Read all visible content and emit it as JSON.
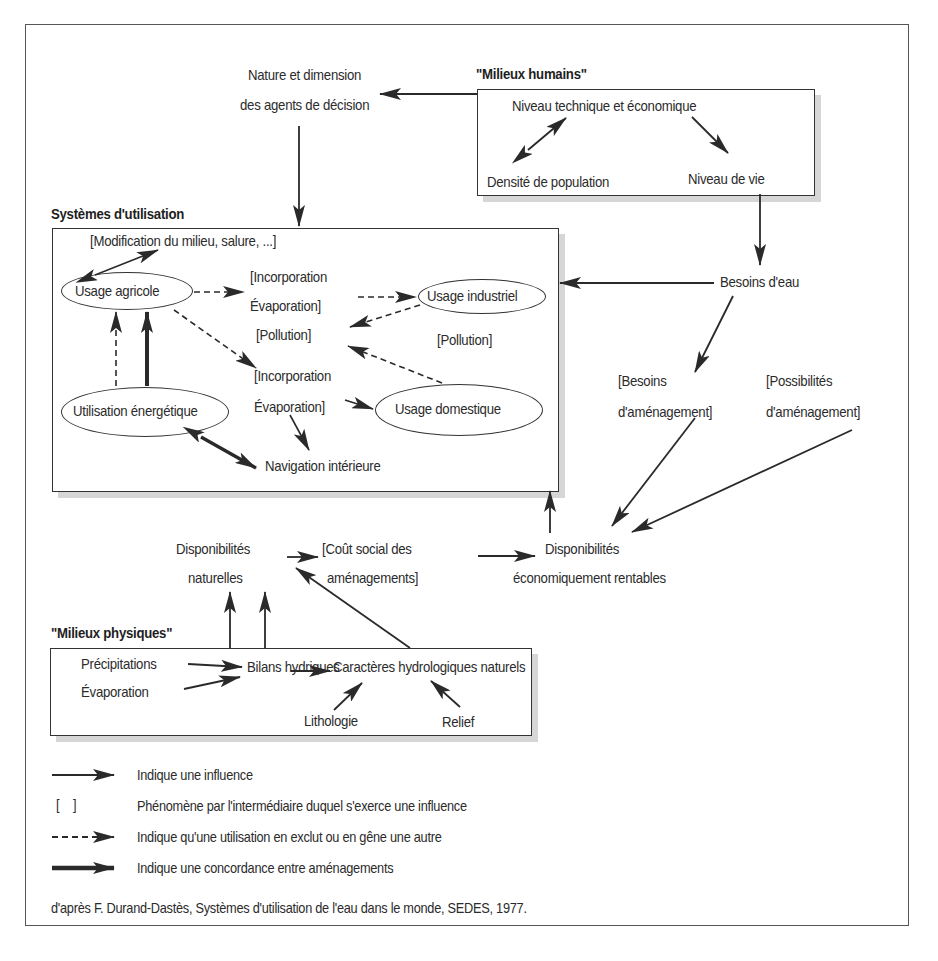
{
  "diagram": {
    "headers": {
      "humains": "\"Milieux humains\"",
      "systemes": "Systèmes d'utilisation",
      "physiques": "\"Milieux physiques\""
    },
    "top": {
      "nature_line1": "Nature et dimension",
      "nature_line2": "des agents de décision"
    },
    "humains_box": {
      "niveau_technique": "Niveau technique et économique",
      "densite": "Densité de population",
      "niveau_vie": "Niveau de vie"
    },
    "systemes_box": {
      "modification": "[Modification du milieu, salure, ...]",
      "usage_agricole": "Usage agricole",
      "usage_industriel": "Usage industriel",
      "usage_domestique": "Usage domestique",
      "utilisation_energetique": "Utilisation énergétique",
      "navigation": "Navigation intérieure",
      "incorporation1_line1": "[Incorporation",
      "incorporation1_line2": "Évaporation]",
      "incorporation2_line1": "[Incorporation",
      "incorporation2_line2": "Évaporation]",
      "pollution1": "[Pollution]",
      "pollution2": "[Pollution]"
    },
    "right": {
      "besoins_eau": "Besoins d'eau",
      "besoins_amenagement_line1": "[Besoins",
      "besoins_amenagement_line2": "d'aménagement]",
      "possibilites_line1": "[Possibilités",
      "possibilites_line2": "d'aménagement]"
    },
    "middle": {
      "dispo_nat_line1": "Disponibilités",
      "dispo_nat_line2": "naturelles",
      "cout_line1": "[Coût social des",
      "cout_line2": "aménagements]",
      "dispo_eco_line1": "Disponibilités",
      "dispo_eco_line2": "économiquement rentables"
    },
    "physiques_box": {
      "precipitations": "Précipitations",
      "evaporation": "Évaporation",
      "bilans": "Bilans hydriques",
      "caracteres": "Caractères hydrologiques naturels",
      "lithologie": "Lithologie",
      "relief": "Relief"
    }
  },
  "legend": {
    "items": [
      {
        "symbol": "solid-arrow",
        "label": "Indique une influence"
      },
      {
        "symbol": "[ ]",
        "label": "Phénomène par l'intermédiaire duquel s'exerce une influence"
      },
      {
        "symbol": "dashed-arrow",
        "label": "Indique qu'une utilisation en exclut ou en gêne une autre"
      },
      {
        "symbol": "thick-arrow",
        "label": "Indique une concordance entre aménagements"
      }
    ]
  },
  "source": "d'après F. Durand-Dastès, Systèmes d'utilisation de l'eau dans le monde, SEDES, 1977.",
  "colors": {
    "line": "#2a2a2a",
    "shadow": "#d6d6d6",
    "frame": "#555555"
  }
}
